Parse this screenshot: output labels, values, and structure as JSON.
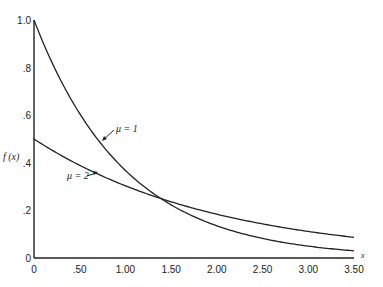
{
  "chart_data": {
    "type": "line",
    "title": "",
    "xlabel": "x",
    "ylabel": "f(x)",
    "xlim": [
      0,
      3.5
    ],
    "ylim": [
      0,
      1.0
    ],
    "grid": false,
    "legend": "inline annotations with arrows",
    "x_ticks": [
      "0",
      ".50",
      "1.00",
      "1.50",
      "2.00",
      "2.50",
      "3.00",
      "3.50"
    ],
    "x_tick_values": [
      0,
      0.5,
      1.0,
      1.5,
      2.0,
      2.5,
      3.0,
      3.5
    ],
    "y_ticks": [
      "0",
      ".2",
      ".4",
      ".6",
      ".8",
      "1.0"
    ],
    "y_tick_values": [
      0,
      0.2,
      0.4,
      0.6,
      0.8,
      1.0
    ],
    "x": [
      0,
      0.25,
      0.5,
      0.75,
      1.0,
      1.25,
      1.5,
      1.75,
      2.0,
      2.25,
      2.5,
      2.75,
      3.0,
      3.25,
      3.5
    ],
    "series": [
      {
        "name": "μ = 1",
        "values": [
          1.0,
          0.779,
          0.607,
          0.472,
          0.368,
          0.287,
          0.223,
          0.174,
          0.135,
          0.105,
          0.082,
          0.064,
          0.05,
          0.039,
          0.03
        ]
      },
      {
        "name": "μ = 2",
        "values": [
          0.5,
          0.441,
          0.389,
          0.344,
          0.303,
          0.268,
          0.236,
          0.208,
          0.184,
          0.162,
          0.143,
          0.126,
          0.112,
          0.098,
          0.087
        ]
      }
    ],
    "annotations": [
      {
        "text": "μ = 1",
        "x": 0.98,
        "y": 0.52
      },
      {
        "text": "μ = 2",
        "x": 0.55,
        "y": 0.38
      }
    ]
  },
  "labels": {
    "ylabel": "f (x)",
    "xlabel": "x",
    "mu1": "μ = 1",
    "mu2": "μ = 2"
  }
}
